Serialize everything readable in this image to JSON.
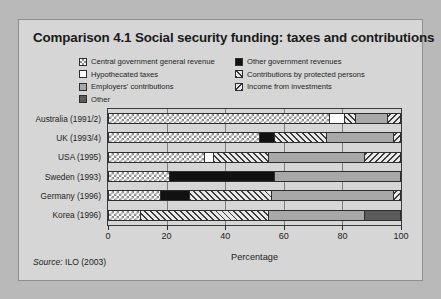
{
  "figure": {
    "title": "Comparison 4.1  Social security funding: taxes and contributions",
    "source_prefix": "Source:",
    "source_text": " ILO (2003)"
  },
  "legend": {
    "left_column": [
      {
        "label": "Central government general revenue",
        "pattern": "check",
        "swatch_name": "legend-swatch-central-government-general-revenue"
      },
      {
        "label": "Hypothecated taxes",
        "pattern": "white",
        "swatch_name": "legend-swatch-hypothecated-taxes"
      },
      {
        "label": "Employers' contributions",
        "pattern": "lgray",
        "swatch_name": "legend-swatch-employers-contributions"
      },
      {
        "label": "Other",
        "pattern": "dgray",
        "swatch_name": "legend-swatch-other"
      }
    ],
    "right_column": [
      {
        "label": "Other government revenues",
        "pattern": "black",
        "swatch_name": "legend-swatch-other-government-revenues"
      },
      {
        "label": "Contributions by protected persons",
        "pattern": "hatch",
        "swatch_name": "legend-swatch-contributions-by-protected-persons"
      },
      {
        "label": "Income from investments",
        "pattern": "bhatch",
        "swatch_name": "legend-swatch-income-from-investments"
      }
    ]
  },
  "colors": {
    "page_background": "#b9b9b9",
    "figure_background": "#d6d6d6",
    "axis": "#2e2e2e",
    "gridline": "#7d7d7d",
    "light_gray_fill": "#a8a8a8",
    "dark_gray_fill": "#5b5b5b",
    "black_fill": "#111111",
    "white_fill": "#ffffff"
  },
  "chart_data": {
    "type": "bar",
    "orientation": "horizontal",
    "stacked": true,
    "title": "Comparison 4.1  Social security funding: taxes and contributions",
    "xlabel": "Percentage",
    "ylabel": "",
    "xlim": [
      0,
      100
    ],
    "xticks": [
      0,
      20,
      40,
      60,
      80,
      100
    ],
    "grid": true,
    "legend_position": "top",
    "categories": [
      "Australia (1991/2)",
      "UK (1993/4)",
      "USA (1995)",
      "Sweden (1993)",
      "Germany (1996)",
      "Korea (1996)"
    ],
    "series": [
      {
        "name": "Central government general revenue",
        "pattern": "check",
        "values": [
          76,
          52,
          33,
          21,
          18,
          11
        ]
      },
      {
        "name": "Hypothecated taxes",
        "pattern": "white",
        "values": [
          5,
          0,
          3,
          0,
          0,
          0
        ]
      },
      {
        "name": "Other government revenues",
        "pattern": "black",
        "values": [
          0,
          5,
          0,
          36,
          10,
          0
        ]
      },
      {
        "name": "Contributions by protected persons",
        "pattern": "hatch",
        "values": [
          4,
          18,
          19,
          0,
          28,
          44
        ]
      },
      {
        "name": "Employers' contributions",
        "pattern": "lgray",
        "values": [
          11,
          23,
          33,
          43,
          42,
          33
        ]
      },
      {
        "name": "Income from investments",
        "pattern": "bhatch",
        "values": [
          4,
          2,
          12,
          0,
          2,
          0
        ]
      },
      {
        "name": "Other",
        "pattern": "dgray",
        "values": [
          0,
          0,
          0,
          0,
          0,
          12
        ]
      }
    ],
    "bars": [
      {
        "category": "Australia (1991/2)",
        "segments": [
          {
            "series": "Central government general revenue",
            "pattern": "check",
            "start": 0,
            "end": 76,
            "value": 76
          },
          {
            "series": "Hypothecated taxes",
            "pattern": "white",
            "start": 76,
            "end": 81,
            "value": 5
          },
          {
            "series": "Contributions by protected persons",
            "pattern": "hatch",
            "start": 81,
            "end": 85,
            "value": 4
          },
          {
            "series": "Employers' contributions",
            "pattern": "lgray",
            "start": 85,
            "end": 96,
            "value": 11
          },
          {
            "series": "Income from investments",
            "pattern": "bhatch",
            "start": 96,
            "end": 100,
            "value": 4
          }
        ]
      },
      {
        "category": "UK (1993/4)",
        "segments": [
          {
            "series": "Central government general revenue",
            "pattern": "check",
            "start": 0,
            "end": 52,
            "value": 52
          },
          {
            "series": "Other government revenues",
            "pattern": "black",
            "start": 52,
            "end": 57,
            "value": 5
          },
          {
            "series": "Contributions by protected persons",
            "pattern": "hatch",
            "start": 57,
            "end": 75,
            "value": 18
          },
          {
            "series": "Employers' contributions",
            "pattern": "lgray",
            "start": 75,
            "end": 98,
            "value": 23
          },
          {
            "series": "Income from investments",
            "pattern": "bhatch",
            "start": 98,
            "end": 100,
            "value": 2
          }
        ]
      },
      {
        "category": "USA (1995)",
        "segments": [
          {
            "series": "Central government general revenue",
            "pattern": "check",
            "start": 0,
            "end": 33,
            "value": 33
          },
          {
            "series": "Hypothecated taxes",
            "pattern": "white",
            "start": 33,
            "end": 36,
            "value": 3
          },
          {
            "series": "Contributions by protected persons",
            "pattern": "hatch",
            "start": 36,
            "end": 55,
            "value": 19
          },
          {
            "series": "Employers' contributions",
            "pattern": "lgray",
            "start": 55,
            "end": 88,
            "value": 33
          },
          {
            "series": "Income from investments",
            "pattern": "bhatch",
            "start": 88,
            "end": 100,
            "value": 12
          }
        ]
      },
      {
        "category": "Sweden (1993)",
        "segments": [
          {
            "series": "Central government general revenue",
            "pattern": "check",
            "start": 0,
            "end": 21,
            "value": 21
          },
          {
            "series": "Other government revenues",
            "pattern": "black",
            "start": 21,
            "end": 57,
            "value": 36
          },
          {
            "series": "Employers' contributions",
            "pattern": "lgray",
            "start": 57,
            "end": 100,
            "value": 43
          }
        ]
      },
      {
        "category": "Germany (1996)",
        "segments": [
          {
            "series": "Central government general revenue",
            "pattern": "check",
            "start": 0,
            "end": 18,
            "value": 18
          },
          {
            "series": "Other government revenues",
            "pattern": "black",
            "start": 18,
            "end": 28,
            "value": 10
          },
          {
            "series": "Contributions by protected persons",
            "pattern": "hatch",
            "start": 28,
            "end": 56,
            "value": 28
          },
          {
            "series": "Employers' contributions",
            "pattern": "lgray",
            "start": 56,
            "end": 98,
            "value": 42
          },
          {
            "series": "Income from investments",
            "pattern": "bhatch",
            "start": 98,
            "end": 100,
            "value": 2
          }
        ]
      },
      {
        "category": "Korea (1996)",
        "segments": [
          {
            "series": "Central government general revenue",
            "pattern": "check",
            "start": 0,
            "end": 11,
            "value": 11
          },
          {
            "series": "Contributions by protected persons",
            "pattern": "hatch",
            "start": 11,
            "end": 55,
            "value": 44
          },
          {
            "series": "Employers' contributions",
            "pattern": "lgray",
            "start": 55,
            "end": 88,
            "value": 33
          },
          {
            "series": "Other",
            "pattern": "dgray",
            "start": 88,
            "end": 100,
            "value": 12
          }
        ]
      }
    ]
  }
}
